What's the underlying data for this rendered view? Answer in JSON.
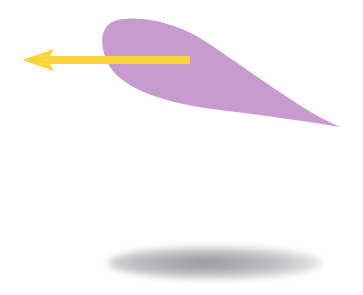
{
  "diagram": {
    "colors": {
      "background": "#ffffff",
      "airfoil": "#c89bcf",
      "arrow": "#f9d43a",
      "shadow": "#8a8a8f"
    },
    "elements": [
      {
        "name": "airfoil",
        "shape": "teardrop-wing-profile",
        "leading_edge": [
          103,
          60
        ],
        "trailing_edge": [
          340,
          127
        ]
      },
      {
        "name": "arrow",
        "direction": "left",
        "tail": [
          190,
          60
        ],
        "head": [
          22,
          60
        ]
      },
      {
        "name": "shadow",
        "shape": "ellipse",
        "center": [
          215,
          262
        ]
      }
    ]
  }
}
